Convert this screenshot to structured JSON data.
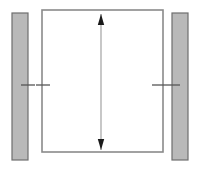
{
  "canvas": {
    "width": 201,
    "height": 169,
    "background": "#ffffff",
    "title": "Vertical dimension diagram with two side posts"
  },
  "colors": {
    "post_fill": "#b9b9b9",
    "post_stroke": "#6e6e6e",
    "frame_fill": "#ffffff",
    "frame_stroke": "#8a8a8a",
    "dimension_line": "#9a9a9a",
    "arrowhead": "#1a1a1a",
    "tick_mark": "#555555"
  },
  "shapes": {
    "main_frame": {
      "name": "main-frame-rectangle",
      "x": 42,
      "y": 10,
      "width": 121,
      "height": 142,
      "stroke_width": 1.6
    },
    "left_post": {
      "name": "left-post-rectangle",
      "x": 12,
      "y": 13,
      "width": 16,
      "height": 147,
      "stroke_width": 1.2
    },
    "right_post": {
      "name": "right-post-rectangle",
      "x": 172,
      "y": 13,
      "width": 16,
      "height": 147,
      "stroke_width": 1.2
    }
  },
  "dimension": {
    "name": "vertical-dimension-arrow",
    "orientation": "vertical",
    "x": 101,
    "y_top": 14,
    "y_bottom": 150,
    "line_width": 1.1,
    "arrow_half_width": 3.2,
    "arrow_length": 11,
    "label": ""
  },
  "tick_marks": {
    "y": 85,
    "stroke_width": 1.3,
    "items": [
      {
        "name": "tick-left-post-inner",
        "x1": 21,
        "x2": 35,
        "y": 85
      },
      {
        "name": "tick-frame-left-edge",
        "x1": 36,
        "x2": 50,
        "y": 85
      },
      {
        "name": "tick-frame-right-edge",
        "x1": 152,
        "x2": 166,
        "y": 85
      },
      {
        "name": "tick-right-post-inner",
        "x1": 166,
        "x2": 180,
        "y": 85
      }
    ]
  }
}
